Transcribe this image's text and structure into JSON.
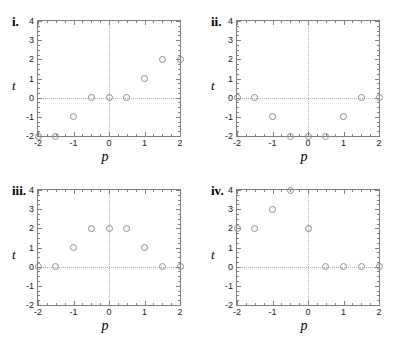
{
  "figure": {
    "background": "#ffffff",
    "marker_color": "#8c8c8c",
    "axis_color": "#808080",
    "grid_color": "#b4b4b4"
  },
  "chart_data": [
    {
      "type": "scatter",
      "title": "i.",
      "xlabel": "p",
      "ylabel": "t",
      "xlim": [
        -2,
        2
      ],
      "ylim": [
        -2,
        4
      ],
      "xticks": [
        -2,
        -1,
        0,
        1,
        2
      ],
      "yticks": [
        -2,
        -1,
        0,
        1,
        2,
        3,
        4
      ],
      "xticklabels": [
        "-2",
        "-1",
        "0",
        "1",
        "2"
      ],
      "yticklabels": [
        "-2",
        "-1",
        "0",
        "1",
        "2",
        "3",
        "4"
      ],
      "grid": "dotted at x=0 and y=0",
      "x": [
        -2,
        -1.5,
        -1,
        -0.5,
        0,
        0.5,
        1,
        1.5,
        2
      ],
      "y": [
        -2,
        -2,
        -1,
        0,
        0,
        0,
        1,
        2,
        2
      ]
    },
    {
      "type": "scatter",
      "title": "ii.",
      "xlabel": "p",
      "ylabel": "t",
      "xlim": [
        -2,
        2
      ],
      "ylim": [
        -2,
        4
      ],
      "xticks": [
        -2,
        -1,
        0,
        1,
        2
      ],
      "yticks": [
        -2,
        -1,
        0,
        1,
        2,
        3,
        4
      ],
      "xticklabels": [
        "-2",
        "-1",
        "0",
        "1",
        "2"
      ],
      "yticklabels": [
        "-2",
        "-1",
        "0",
        "1",
        "2",
        "3",
        "4"
      ],
      "grid": "dotted at x=0 and y=0",
      "x": [
        -2,
        -1.5,
        -1,
        -0.5,
        0,
        0.5,
        1,
        1.5,
        2
      ],
      "y": [
        0,
        0,
        -1,
        -2,
        -2,
        -2,
        -1,
        0,
        0
      ]
    },
    {
      "type": "scatter",
      "title": "iii.",
      "xlabel": "p",
      "ylabel": "t",
      "xlim": [
        -2,
        2
      ],
      "ylim": [
        -2,
        4
      ],
      "xticks": [
        -2,
        -1,
        0,
        1,
        2
      ],
      "yticks": [
        -2,
        -1,
        0,
        1,
        2,
        3,
        4
      ],
      "xticklabels": [
        "-2",
        "-1",
        "0",
        "1",
        "2"
      ],
      "yticklabels": [
        "-2",
        "-1",
        "0",
        "1",
        "2",
        "3",
        "4"
      ],
      "grid": "dotted at x=0 and y=0",
      "x": [
        -2,
        -1.5,
        -1,
        -0.5,
        0,
        0.5,
        1,
        1.5,
        2
      ],
      "y": [
        0,
        0,
        1,
        2,
        2,
        2,
        1,
        0,
        0
      ]
    },
    {
      "type": "scatter",
      "title": "iv.",
      "xlabel": "p",
      "ylabel": "t",
      "xlim": [
        -2,
        2
      ],
      "ylim": [
        -2,
        4
      ],
      "xticks": [
        -2,
        -1,
        0,
        1,
        2
      ],
      "yticks": [
        -2,
        -1,
        0,
        1,
        2,
        3,
        4
      ],
      "xticklabels": [
        "-2",
        "-1",
        "0",
        "1",
        "2"
      ],
      "yticklabels": [
        "-2",
        "-1",
        "0",
        "1",
        "2",
        "3",
        "4"
      ],
      "grid": "dotted at x=0 and y=0",
      "x": [
        -2,
        -1.5,
        -1,
        -0.5,
        0,
        0.5,
        1,
        1.5,
        2
      ],
      "y": [
        2,
        2,
        3,
        4,
        2,
        0,
        0,
        0,
        0
      ]
    }
  ]
}
